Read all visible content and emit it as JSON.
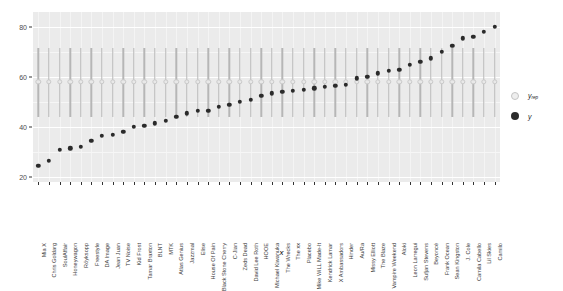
{
  "chart_data": {
    "type": "scatter",
    "title": "",
    "subtitle": "",
    "xlabel": "x",
    "ylabel": "",
    "ylim": [
      18,
      86
    ],
    "yticks": [
      20,
      40,
      60,
      80
    ],
    "grid": true,
    "legend_position": "right",
    "legend": [
      {
        "name": "y_rep",
        "label": "y",
        "sublabel": "rep",
        "marker": "open-circle",
        "color": "#e8e8e8"
      },
      {
        "name": "y",
        "label": "y",
        "sublabel": "",
        "marker": "filled-circle",
        "color": "#2b2b2b"
      }
    ],
    "categories": [
      "Mia X",
      "Chris Goldarg",
      "SoulAffair",
      "Honeywagon",
      "Röyksopp",
      "Freestyle",
      "DA Image",
      "Jean Juan",
      "TV Noise",
      "Kid Frost",
      "Tamar Braxton",
      "BLNT",
      "MTK",
      "Atlas Genius",
      "Jazzmal",
      "Elise",
      "House Of Pain",
      "Black Stone Cherry",
      "C-Jian",
      "Zeds Dead",
      "David Lee Roth",
      "HOOE",
      "Michael Kiwanuka",
      "The Wrecks",
      "The xx",
      "Placebo",
      "Mike WiLL Made-It",
      "Kendrick Lamar",
      "X Ambassadors",
      "Hinder",
      "Au/Ra",
      "Missy Elliott",
      "The Blaze",
      "Vampire Weekend",
      "Aloki",
      "Leon Larregui",
      "Sufjan Stevens",
      "Beyoncé",
      "Frank Ocean",
      "Sean Kingston",
      "J. Cole",
      "Camila Cabello",
      "Lil Skies",
      "Camilo"
    ],
    "series": [
      {
        "name": "y_rep",
        "marker": "open-circle",
        "values": [
          58.0,
          58.0,
          58.0,
          58.0,
          58.0,
          58.0,
          58.0,
          58.0,
          58.0,
          58.0,
          58.0,
          58.0,
          58.0,
          58.0,
          58.0,
          58.0,
          58.0,
          58.0,
          58.0,
          58.0,
          58.0,
          58.0,
          58.0,
          58.0,
          58.0,
          58.0,
          58.0,
          58.0,
          58.0,
          58.0,
          58.0,
          58.0,
          58.0,
          58.0,
          58.0,
          58.0,
          58.0,
          58.0,
          58.0,
          58.0,
          58.0,
          58.0,
          58.0,
          58.0
        ],
        "error_low": [
          44.0,
          44.0,
          44.0,
          44.0,
          44.0,
          44.0,
          44.0,
          44.0,
          44.0,
          44.0,
          44.0,
          44.0,
          44.0,
          44.0,
          44.0,
          44.0,
          44.0,
          44.0,
          44.0,
          44.0,
          44.0,
          44.0,
          44.0,
          44.0,
          44.0,
          44.0,
          44.0,
          44.0,
          44.0,
          44.0,
          44.0,
          44.0,
          44.0,
          44.0,
          44.0,
          44.0,
          44.0,
          44.0,
          44.0,
          44.0,
          44.0,
          44.0,
          44.0,
          44.0
        ],
        "error_high": [
          71.5,
          71.5,
          71.5,
          71.5,
          71.5,
          71.5,
          71.5,
          71.5,
          71.5,
          71.5,
          71.5,
          71.5,
          71.5,
          71.5,
          71.5,
          71.5,
          71.5,
          71.5,
          71.5,
          71.5,
          71.5,
          71.5,
          71.5,
          71.5,
          71.5,
          71.5,
          71.5,
          71.5,
          71.5,
          71.5,
          71.5,
          71.5,
          71.5,
          71.5,
          71.5,
          71.5,
          71.5,
          71.5,
          71.5,
          71.5,
          71.5,
          71.5,
          71.5,
          71.5
        ]
      },
      {
        "name": "y",
        "marker": "filled-circle",
        "values": [
          24.5,
          26.5,
          31.0,
          31.5,
          32.0,
          34.5,
          36.5,
          37.0,
          38.0,
          40.0,
          40.5,
          41.5,
          42.5,
          44.0,
          45.5,
          46.5,
          46.5,
          48.0,
          49.0,
          50.0,
          51.0,
          52.5,
          53.5,
          54.0,
          54.5,
          55.0,
          55.5,
          56.0,
          56.5,
          57.0,
          59.5,
          60.0,
          61.5,
          62.5,
          63.0,
          65.0,
          66.0,
          67.5,
          70.0,
          72.5,
          75.5,
          76.0,
          78.0,
          80.0
        ]
      }
    ]
  },
  "axis": {
    "ytick_labels": [
      "80",
      "60",
      "40",
      "20"
    ],
    "xlabel": "x"
  }
}
